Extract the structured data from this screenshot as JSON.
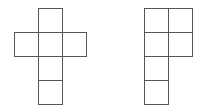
{
  "diagram": {
    "title": "",
    "stroke_color": "#555555",
    "cell_size": 24,
    "figures": [
      {
        "name": "cross-net",
        "cells": [
          {
            "x": 38,
            "y": 8
          },
          {
            "x": 14,
            "y": 32
          },
          {
            "x": 38,
            "y": 32
          },
          {
            "x": 62,
            "y": 32
          },
          {
            "x": 38,
            "y": 56
          },
          {
            "x": 38,
            "y": 80
          }
        ]
      },
      {
        "name": "p-shape-net",
        "cells": [
          {
            "x": 144,
            "y": 8
          },
          {
            "x": 168,
            "y": 8
          },
          {
            "x": 144,
            "y": 32
          },
          {
            "x": 168,
            "y": 32
          },
          {
            "x": 144,
            "y": 56
          },
          {
            "x": 144,
            "y": 80
          }
        ]
      }
    ]
  }
}
